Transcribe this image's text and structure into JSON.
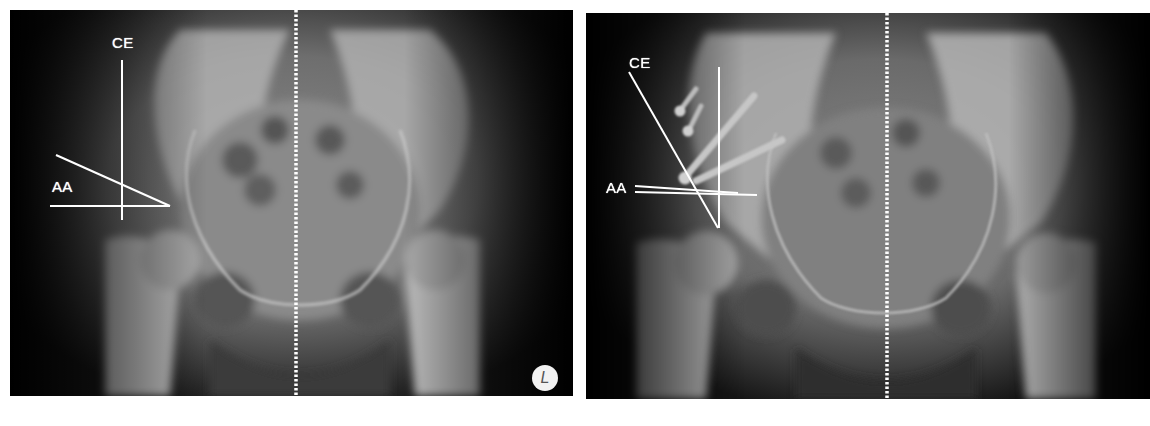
{
  "figure": {
    "panels": [
      {
        "id": "preoperative",
        "labels": {
          "ce": "CE",
          "aa": "AA"
        },
        "side_marker": "L"
      },
      {
        "id": "postoperative",
        "labels": {
          "ce": "CE",
          "aa": "AA"
        }
      }
    ],
    "colors": {
      "background": "#ffffff",
      "film": "#000000",
      "bone": "#c8c8c8",
      "annotation": "#ffffff"
    }
  }
}
